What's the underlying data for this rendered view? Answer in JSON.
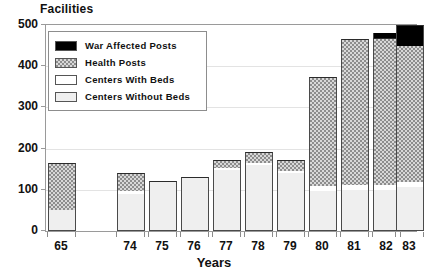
{
  "chart_data": {
    "type": "bar",
    "title": "",
    "ylabel": "Facilities",
    "xlabel": "Years",
    "ylim": [
      0,
      500
    ],
    "yticks": [
      0,
      100,
      200,
      300,
      400,
      500
    ],
    "grid": true,
    "stacked": true,
    "legend_position": "inside-top-left",
    "categories": [
      "65",
      "74",
      "75",
      "76",
      "77",
      "78",
      "79",
      "80",
      "81",
      "82",
      "83"
    ],
    "series": [
      {
        "name": "Centers Without Beds",
        "color": "#efefef",
        "pattern": "solid-light",
        "values": [
          50,
          90,
          118,
          128,
          148,
          160,
          140,
          98,
          100,
          100,
          108
        ]
      },
      {
        "name": "Centers With Beds",
        "color": "#ffffff",
        "pattern": "solid-white",
        "values": [
          0,
          6,
          2,
          2,
          6,
          6,
          5,
          12,
          12,
          12,
          12
        ]
      },
      {
        "name": "Health Posts",
        "color": "#8d8d8d",
        "pattern": "hatched",
        "values": [
          116,
          44,
          0,
          0,
          19,
          26,
          28,
          263,
          353,
          356,
          328
        ]
      },
      {
        "name": "War Affected Posts",
        "color": "#000000",
        "pattern": "solid-black",
        "values": [
          0,
          0,
          0,
          0,
          0,
          0,
          0,
          0,
          0,
          12,
          52
        ]
      }
    ],
    "totals": [
      166,
      140,
      120,
      130,
      173,
      192,
      173,
      373,
      465,
      468,
      500
    ]
  },
  "legend": {
    "items": [
      {
        "label": "War Affected Posts",
        "swatch": "solid-black"
      },
      {
        "label": "Health Posts",
        "swatch": "hatched"
      },
      {
        "label": "Centers With Beds",
        "swatch": "solid-white"
      },
      {
        "label": "Centers Without Beds",
        "swatch": "solid-light"
      }
    ]
  }
}
